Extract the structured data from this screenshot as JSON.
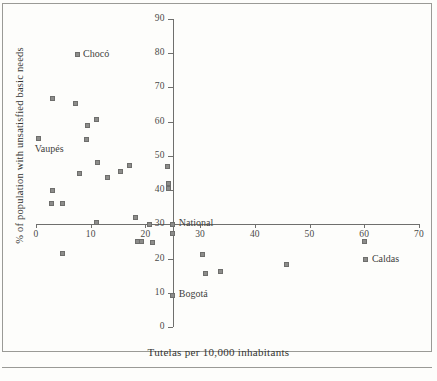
{
  "chart_data": {
    "type": "scatter",
    "title": "",
    "xlabel": "Tutelas per 10,000 inhabitants",
    "ylabel": "% of population with unsatisfied basic needs",
    "xlim": [
      0,
      70
    ],
    "ylim": [
      0,
      90
    ],
    "xticks": [
      0,
      10,
      20,
      30,
      40,
      50,
      60,
      70
    ],
    "yticks": [
      0,
      10,
      20,
      30,
      40,
      50,
      60,
      70,
      80,
      90
    ],
    "xtick_labels": [
      "0",
      "10",
      "20",
      "30",
      "40",
      "50",
      "60",
      "70"
    ],
    "ytick_labels": [
      "0",
      "10",
      "20",
      "30",
      "40",
      "50",
      "60",
      "70",
      "80",
      "90"
    ],
    "grid": false,
    "legend": "none",
    "axis_style": "crossing-axes",
    "x_axis_crosses_y_at": 30,
    "y_axis_crosses_x_at": 25,
    "marker_color": "#8c8c8a",
    "axis_color": "#6f6f6d",
    "points": [
      {
        "x": 7.5,
        "y": 79.5,
        "label": "Chocó",
        "label_pos": "right"
      },
      {
        "x": 3.0,
        "y": 66.8,
        "label": "",
        "label_pos": ""
      },
      {
        "x": 7.3,
        "y": 65.3,
        "label": "",
        "label_pos": ""
      },
      {
        "x": 11.1,
        "y": 60.5,
        "label": "",
        "label_pos": ""
      },
      {
        "x": 9.4,
        "y": 59.0,
        "label": "",
        "label_pos": ""
      },
      {
        "x": 0.5,
        "y": 55.0,
        "label": "Vaupés",
        "label_pos": "below"
      },
      {
        "x": 9.3,
        "y": 54.8,
        "label": "",
        "label_pos": ""
      },
      {
        "x": 11.2,
        "y": 48.0,
        "label": "",
        "label_pos": ""
      },
      {
        "x": 17.0,
        "y": 47.2,
        "label": "",
        "label_pos": ""
      },
      {
        "x": 24.0,
        "y": 47.0,
        "label": "",
        "label_pos": ""
      },
      {
        "x": 15.5,
        "y": 45.5,
        "label": "",
        "label_pos": ""
      },
      {
        "x": 8.0,
        "y": 44.8,
        "label": "",
        "label_pos": ""
      },
      {
        "x": 13.0,
        "y": 43.7,
        "label": "",
        "label_pos": ""
      },
      {
        "x": 24.2,
        "y": 41.8,
        "label": "",
        "label_pos": ""
      },
      {
        "x": 24.2,
        "y": 40.5,
        "label": "",
        "label_pos": ""
      },
      {
        "x": 3.0,
        "y": 40.0,
        "label": "",
        "label_pos": ""
      },
      {
        "x": 2.8,
        "y": 36.2,
        "label": "",
        "label_pos": ""
      },
      {
        "x": 4.8,
        "y": 36.2,
        "label": "",
        "label_pos": ""
      },
      {
        "x": 18.2,
        "y": 32.0,
        "label": "",
        "label_pos": ""
      },
      {
        "x": 11.1,
        "y": 30.4,
        "label": "",
        "label_pos": ""
      },
      {
        "x": 20.7,
        "y": 30.0,
        "label": "",
        "label_pos": ""
      },
      {
        "x": 25.0,
        "y": 30.0,
        "label": "National",
        "label_pos": "right"
      },
      {
        "x": 25.0,
        "y": 27.2,
        "label": "",
        "label_pos": ""
      },
      {
        "x": 18.5,
        "y": 25.0,
        "label": "",
        "label_pos": ""
      },
      {
        "x": 19.3,
        "y": 25.0,
        "label": "",
        "label_pos": ""
      },
      {
        "x": 21.3,
        "y": 24.8,
        "label": "",
        "label_pos": ""
      },
      {
        "x": 60.0,
        "y": 25.0,
        "label": "",
        "label_pos": ""
      },
      {
        "x": 4.8,
        "y": 21.4,
        "label": "",
        "label_pos": ""
      },
      {
        "x": 30.5,
        "y": 21.2,
        "label": "",
        "label_pos": ""
      },
      {
        "x": 60.3,
        "y": 19.6,
        "label": "Caldas",
        "label_pos": "right"
      },
      {
        "x": 45.8,
        "y": 18.4,
        "label": "",
        "label_pos": ""
      },
      {
        "x": 33.7,
        "y": 16.3,
        "label": "",
        "label_pos": ""
      },
      {
        "x": 30.9,
        "y": 15.5,
        "label": "",
        "label_pos": ""
      },
      {
        "x": 25.0,
        "y": 9.3,
        "label": "Bogotá",
        "label_pos": "right"
      }
    ]
  },
  "geometry": {
    "x0_px": 36,
    "y0_px": 327,
    "px_per_x": 5.471,
    "px_per_y": 3.422
  }
}
